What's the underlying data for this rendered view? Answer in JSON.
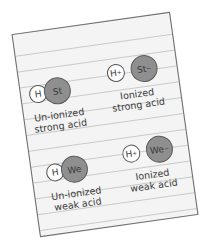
{
  "colors": {
    "card": "#f4f4f4",
    "border": "#6b6b6b",
    "ion_fill": "#8f8f8f",
    "hydrogen_fill": "#ffffff",
    "text": "#3a3a3a"
  },
  "cells": [
    {
      "h": "H",
      "anion": "St",
      "h_charge": "",
      "anion_charge": "",
      "label_line1": "Un-ionized",
      "label_line2": "strong acid"
    },
    {
      "h": "H",
      "anion": "St",
      "h_charge": "+",
      "anion_charge": "−",
      "label_line1": "Ionized",
      "label_line2": "strong acid"
    },
    {
      "h": "H",
      "anion": "We",
      "h_charge": "",
      "anion_charge": "",
      "label_line1": "Un-ionized",
      "label_line2": "weak acid"
    },
    {
      "h": "H",
      "anion": "We",
      "h_charge": "+",
      "anion_charge": "−",
      "label_line1": "Ionized",
      "label_line2": "weak acid"
    }
  ]
}
